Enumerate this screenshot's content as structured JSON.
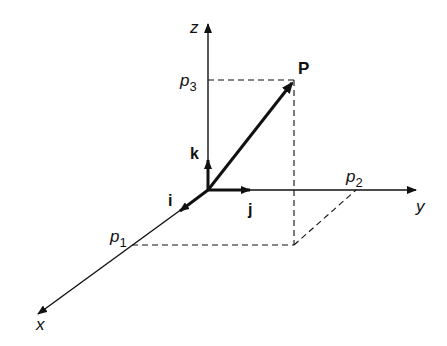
{
  "diagram": {
    "axes": {
      "x": {
        "label": "x"
      },
      "y": {
        "label": "y"
      },
      "z": {
        "label": "z"
      }
    },
    "unit_vectors": {
      "i": {
        "label": "i"
      },
      "j": {
        "label": "j"
      },
      "k": {
        "label": "k"
      }
    },
    "point": {
      "label": "P"
    },
    "components": {
      "p1": {
        "base": "p",
        "sub": "1"
      },
      "p2": {
        "base": "p",
        "sub": "2"
      },
      "p3": {
        "base": "p",
        "sub": "3"
      }
    },
    "colors": {
      "ink": "#111111",
      "background": "#ffffff"
    }
  }
}
